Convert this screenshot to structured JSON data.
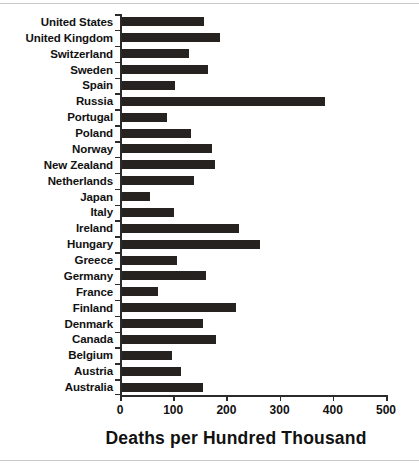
{
  "chart_data": {
    "type": "bar",
    "orientation": "horizontal",
    "title": "",
    "xlabel": "Deaths per Hundred Thousand",
    "ylabel": "",
    "xlim": [
      0,
      500
    ],
    "xticks": [
      0,
      100,
      200,
      300,
      400,
      500
    ],
    "xtick_labels": [
      "0",
      "100",
      "200",
      "300",
      "400",
      "500"
    ],
    "grid": false,
    "legend": null,
    "bar_color": "#262220",
    "axis_color": "#2b2b2b",
    "categories": [
      "United States",
      "United Kingdom",
      "Switzerland",
      "Sweden",
      "Spain",
      "Russia",
      "Portugal",
      "Poland",
      "Norway",
      "New Zealand",
      "Netherlands",
      "Japan",
      "Italy",
      "Ireland",
      "Hungary",
      "Greece",
      "Germany",
      "France",
      "Finland",
      "Denmark",
      "Canada",
      "Belgium",
      "Austria",
      "Australia"
    ],
    "values": [
      154,
      185,
      126,
      161,
      99,
      382,
      85,
      129,
      169,
      175,
      136,
      53,
      98,
      219,
      260,
      104,
      158,
      67,
      215,
      152,
      177,
      94,
      111,
      152
    ]
  }
}
